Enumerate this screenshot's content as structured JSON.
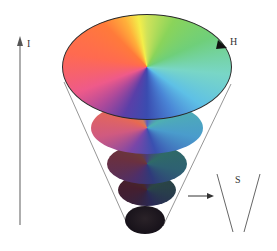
{
  "diagram": {
    "labels": {
      "intensity": "I",
      "hue": "H",
      "saturation": "S"
    },
    "colors": {
      "axis_line": "#777777",
      "outline": "#222222",
      "cone_edge": "#8a8a8a",
      "background": "#ffffff"
    },
    "layers": [
      {
        "name": "top",
        "brightness": 1.0,
        "cx": 147,
        "cy": 67,
        "rx": 85,
        "ry": 53
      },
      {
        "name": "layer-2",
        "brightness": 0.85,
        "cx": 147,
        "cy": 128,
        "rx": 56,
        "ry": 26
      },
      {
        "name": "layer-3",
        "brightness": 0.55,
        "cx": 147,
        "cy": 164,
        "rx": 40,
        "ry": 20
      },
      {
        "name": "layer-4",
        "brightness": 0.35,
        "cx": 147,
        "cy": 190,
        "rx": 29,
        "ry": 16
      },
      {
        "name": "bottom-black",
        "brightness": 0.05,
        "cx": 145,
        "cy": 220,
        "rx": 20,
        "ry": 14
      }
    ]
  }
}
